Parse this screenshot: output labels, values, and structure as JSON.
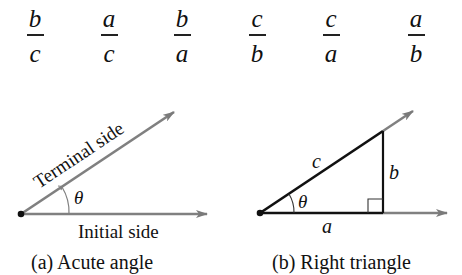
{
  "ratios": [
    {
      "num": "b",
      "den": "c"
    },
    {
      "num": "a",
      "den": "c"
    },
    {
      "num": "b",
      "den": "a"
    },
    {
      "num": "c",
      "den": "b"
    },
    {
      "num": "c",
      "den": "a"
    },
    {
      "num": "a",
      "den": "b"
    }
  ],
  "figure_a": {
    "terminal_label": "Terminal side",
    "initial_label": "Initial side",
    "angle_label": "θ",
    "caption": "(a)  Acute angle"
  },
  "figure_b": {
    "hyp_label": "c",
    "opp_label": "b",
    "adj_label": "a",
    "angle_label": "θ",
    "caption": "(b)  Right triangle"
  },
  "colors": {
    "ray": "#808080",
    "line": "#111111"
  }
}
